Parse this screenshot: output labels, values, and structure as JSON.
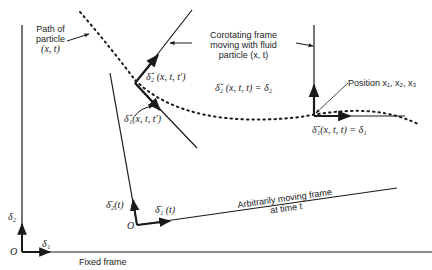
{
  "diagram": {
    "labels": {
      "path_of_particle": {
        "line1": "Path of",
        "line2": "particle",
        "line3": "(x, t)"
      },
      "corotating_frame": {
        "line1": "Corotating frame",
        "line2": "moving with fluid",
        "line3": "particle (x, t)"
      },
      "delta2_xttprime": "δ̌₂ (x, t, t′)",
      "delta1_xttprime": "δ̌₁(x, t, t′)",
      "delta2_xtt": "δ̌₂ (x, t, t) = δ₂",
      "delta1_xtt": "δ̌₁(x, t, t) = δ₁",
      "position": "Position x₁, x₂, x₃",
      "moving_delta2": "δ̄₂(t)",
      "moving_delta1": "δ̄₁ (t)",
      "moving_origin": "O",
      "arbitrarily_moving_frame": {
        "line1": "Arbitrarily moving frame",
        "line2": "at time t"
      },
      "fixed_delta2": "δ₂",
      "fixed_delta1": "δ₁",
      "fixed_origin": "O",
      "fixed_frame": "Fixed frame"
    },
    "colors": {
      "ink": "#1a1a1a",
      "background": "#ffffff"
    }
  }
}
